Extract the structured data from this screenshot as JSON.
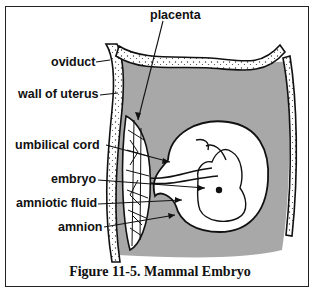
{
  "figure": {
    "caption": "Figure 11-5.  Mammal Embryo",
    "labels": {
      "placenta": "placenta",
      "oviduct": "oviduct",
      "wall_of_uterus": "wall of uterus",
      "umbilical_cord": "umbilical cord",
      "embryo": "embryo",
      "amniotic_fluid": "amniotic fluid",
      "amnion": "amnion"
    },
    "colors": {
      "uterine_cavity": "#a8a8a8",
      "wall": "#ffffff",
      "outline": "#111111"
    }
  }
}
